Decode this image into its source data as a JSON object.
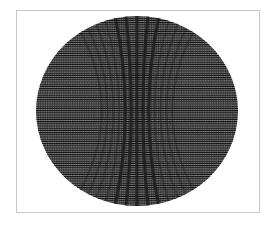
{
  "figure": {
    "kind": "moire-pattern",
    "frame": {
      "x": 16,
      "y": 10,
      "width": 244,
      "height": 203,
      "border_color": "#c8c8c8"
    },
    "disc": {
      "cx": 137,
      "cy": 111,
      "rx": 101,
      "ry": 95
    },
    "colors": {
      "background": "#ffffff",
      "line": "#1a1a1a",
      "disc_base": "#8a8a8a"
    },
    "line_spacing": 2.2
  }
}
